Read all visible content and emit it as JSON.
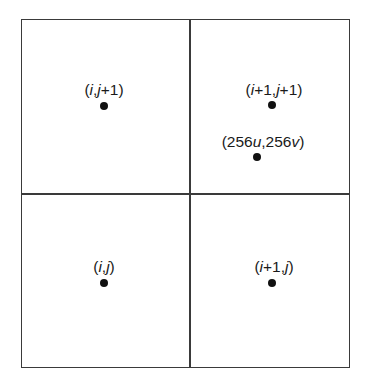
{
  "figure": {
    "background_color": "#ffffff",
    "line_color": "#3a3a3a",
    "dot_color": "#111111",
    "text_color": "#1a1a1a"
  },
  "grid": {
    "columns": 2,
    "rows": 2,
    "frame": {
      "x": 21,
      "y": 19,
      "width": 329,
      "height": 349
    },
    "divider_vertical_x": 189,
    "divider_horizontal_y": 193
  },
  "labels": [
    {
      "id": "texel-top-left",
      "text": "(i,j+1)",
      "parts": [
        {
          "t": "(",
          "style": "paren"
        },
        {
          "t": "i",
          "style": "var"
        },
        {
          "t": ",",
          "style": "paren"
        },
        {
          "t": "j",
          "style": "var"
        },
        {
          "t": "+1)",
          "style": "num"
        }
      ],
      "x": 104,
      "y": 82,
      "dot": {
        "x": 104,
        "y": 106
      }
    },
    {
      "id": "texel-top-right",
      "text": "(i+1,j+1)",
      "parts": [
        {
          "t": "(",
          "style": "paren"
        },
        {
          "t": "i",
          "style": "var"
        },
        {
          "t": "+1,",
          "style": "num"
        },
        {
          "t": "j",
          "style": "var"
        },
        {
          "t": "+1)",
          "style": "num"
        }
      ],
      "x": 274,
      "y": 82,
      "dot": {
        "x": 272,
        "y": 105
      }
    },
    {
      "id": "sample-point",
      "text": "(256u,256v)",
      "parts": [
        {
          "t": "(256",
          "style": "num"
        },
        {
          "t": "u",
          "style": "var"
        },
        {
          "t": ",256",
          "style": "num"
        },
        {
          "t": "v",
          "style": "var"
        },
        {
          "t": ")",
          "style": "paren"
        }
      ],
      "x": 263,
      "y": 134,
      "dot": {
        "x": 257,
        "y": 157
      }
    },
    {
      "id": "texel-bottom-left",
      "text": "(i,j)",
      "parts": [
        {
          "t": "(",
          "style": "paren"
        },
        {
          "t": "i",
          "style": "var"
        },
        {
          "t": ",",
          "style": "paren"
        },
        {
          "t": "j",
          "style": "var"
        },
        {
          "t": ")",
          "style": "paren"
        }
      ],
      "x": 104,
      "y": 259,
      "dot": {
        "x": 104,
        "y": 283
      }
    },
    {
      "id": "texel-bottom-right",
      "text": "(i+1,j)",
      "parts": [
        {
          "t": "(",
          "style": "paren"
        },
        {
          "t": "i",
          "style": "var"
        },
        {
          "t": "+1,",
          "style": "num"
        },
        {
          "t": "j",
          "style": "var"
        },
        {
          "t": ")",
          "style": "paren"
        }
      ],
      "x": 274,
      "y": 259,
      "dot": {
        "x": 272,
        "y": 283
      }
    }
  ]
}
